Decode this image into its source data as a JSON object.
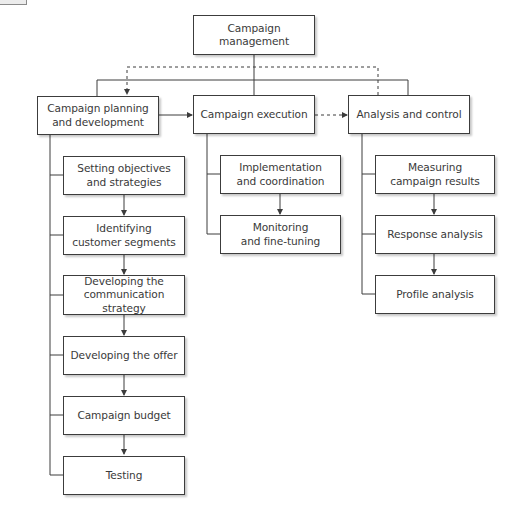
{
  "diagram": {
    "root": {
      "label": "Campaign management"
    },
    "branches": [
      {
        "label": "Campaign planning\nand development",
        "children": [
          {
            "label": "Setting objectives\nand strategies"
          },
          {
            "label": "Identifying\ncustomer segments"
          },
          {
            "label": "Developing the\ncommunication strategy"
          },
          {
            "label": "Developing the offer"
          },
          {
            "label": "Campaign budget"
          },
          {
            "label": "Testing"
          }
        ]
      },
      {
        "label": "Campaign execution",
        "children": [
          {
            "label": "Implementation\nand coordination"
          },
          {
            "label": "Monitoring\nand fine-tuning"
          }
        ]
      },
      {
        "label": "Analysis and control",
        "children": [
          {
            "label": "Measuring\ncampaign results"
          },
          {
            "label": "Response analysis"
          },
          {
            "label": "Profile analysis"
          }
        ]
      }
    ],
    "connections": [
      {
        "from": "Campaign planning and development",
        "to": "Campaign execution",
        "style": "solid-arrow"
      },
      {
        "from": "Campaign execution",
        "to": "Analysis and control",
        "style": "dashed-arrow"
      },
      {
        "from": "Analysis and control",
        "to": "Campaign planning and development",
        "style": "dashed-feedback-arrow"
      }
    ],
    "colors": {
      "line": "#3c3c3c",
      "text": "#3a3a3a",
      "background": "#ffffff"
    }
  }
}
